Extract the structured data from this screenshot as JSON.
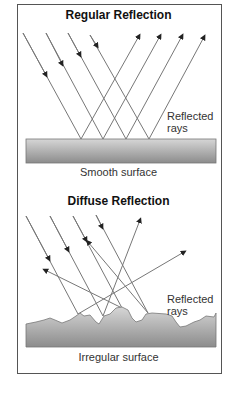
{
  "regular": {
    "title": "Regular Reflection",
    "reflected_label_1": "Reflected",
    "reflected_label_2": "rays",
    "surface_label": "Smooth surface"
  },
  "diffuse": {
    "title": "Diffuse Reflection",
    "reflected_label_1": "Reflected",
    "reflected_label_2": "rays",
    "surface_label": "Irregular surface"
  },
  "colors": {
    "ray": "#777777",
    "surface_top": "#d8d8d8",
    "surface_bottom": "#8a8a8a",
    "border": "#555555"
  }
}
